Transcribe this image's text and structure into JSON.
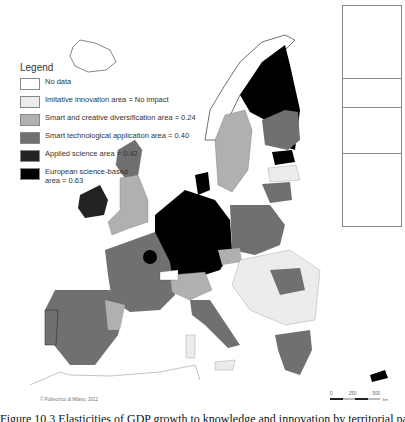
{
  "legend": {
    "title": "Legend",
    "items": [
      {
        "label": "No data",
        "color": "#ffffff"
      },
      {
        "label": "Imitative innovation area = No impact",
        "color": "#ececec"
      },
      {
        "label": "Smart and creative diversification area = 0.24",
        "color": "#b0b0b0"
      },
      {
        "label": "Smart technological application area = 0.40",
        "color": "#707070"
      },
      {
        "label": "Applied science area = 0.42",
        "color": "#222222"
      },
      {
        "label": "European science-based area = 0.63",
        "color": "#000000"
      }
    ]
  },
  "copyright": "© Politecnico di Milano, 2012",
  "scale": {
    "ticks": [
      "0",
      "250",
      "500"
    ],
    "unit": "km"
  },
  "caption": "Figure 10.3 Elasticities of GDP growth to knowledge and innovation by territorial patterns of innovation"
}
